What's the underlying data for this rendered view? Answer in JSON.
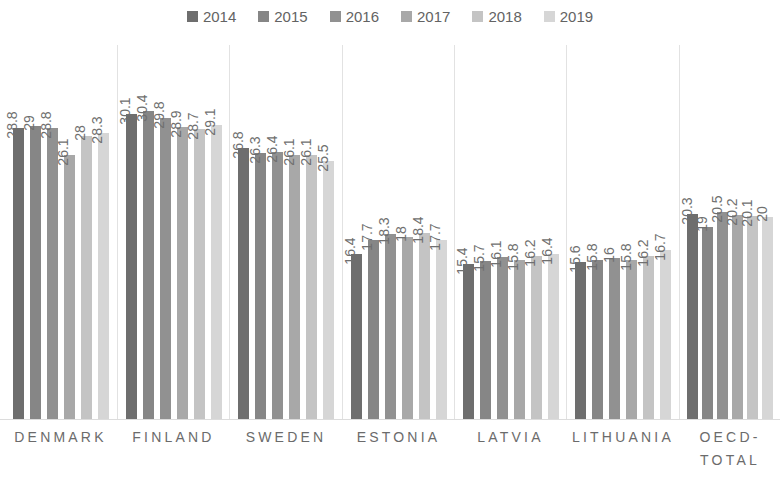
{
  "legend": {
    "position": "top-center",
    "items": [
      {
        "label": "2014",
        "color": "#6e6e6e"
      },
      {
        "label": "2015",
        "color": "#868686"
      },
      {
        "label": "2016",
        "color": "#919191"
      },
      {
        "label": "2017",
        "color": "#a8a8a8"
      },
      {
        "label": "2018",
        "color": "#c4c4c4"
      },
      {
        "label": "2019",
        "color": "#d6d6d6"
      }
    ]
  },
  "chart_data": {
    "type": "bar",
    "title": "",
    "xlabel": "",
    "ylabel": "",
    "grid": false,
    "legend_position": "top-center",
    "ylim": [
      0,
      31
    ],
    "categories": [
      "DENMARK",
      "FINLAND",
      "SWEDEN",
      "ESTONIA",
      "LATVIA",
      "LITHUANIA",
      "OECD-TOTAL"
    ],
    "series": [
      {
        "name": "2014",
        "color": "#6e6e6e",
        "values": [
          28.8,
          30.1,
          26.8,
          16.4,
          15.4,
          15.6,
          20.3
        ]
      },
      {
        "name": "2015",
        "color": "#868686",
        "values": [
          29,
          30.4,
          26.3,
          17.7,
          15.7,
          15.8,
          19
        ]
      },
      {
        "name": "2016",
        "color": "#919191",
        "values": [
          28.8,
          29.8,
          26.4,
          18.3,
          16.1,
          16,
          20.5
        ]
      },
      {
        "name": "2017",
        "color": "#a8a8a8",
        "values": [
          26.1,
          28.9,
          26.1,
          18,
          15.8,
          15.8,
          20.2
        ]
      },
      {
        "name": "2018",
        "color": "#c4c4c4",
        "values": [
          28,
          28.7,
          26.1,
          18.4,
          16.2,
          16.2,
          20.1
        ]
      },
      {
        "name": "2019",
        "color": "#d6d6d6",
        "values": [
          28.3,
          29.1,
          25.5,
          17.7,
          16.4,
          16.7,
          20
        ]
      }
    ],
    "data_labels": [
      [
        "28.8",
        "29",
        "28.8",
        "26.1",
        "28",
        "28.3"
      ],
      [
        "30.1",
        "30.4",
        "29.8",
        "28.9",
        "28.7",
        "29.1"
      ],
      [
        "26.8",
        "26.3",
        "26.4",
        "26.1",
        "26.1",
        "25.5"
      ],
      [
        "16.4",
        "17.7",
        "18.3",
        "18",
        "18.4",
        "17.7"
      ],
      [
        "15.4",
        "15.7",
        "16.1",
        "15.8",
        "16.2",
        "16.4"
      ],
      [
        "15.6",
        "15.8",
        "16",
        "15.8",
        "16.2",
        "16.7"
      ],
      [
        "20.3",
        "19",
        "20.5",
        "20.2",
        "20.1",
        "20"
      ]
    ]
  }
}
